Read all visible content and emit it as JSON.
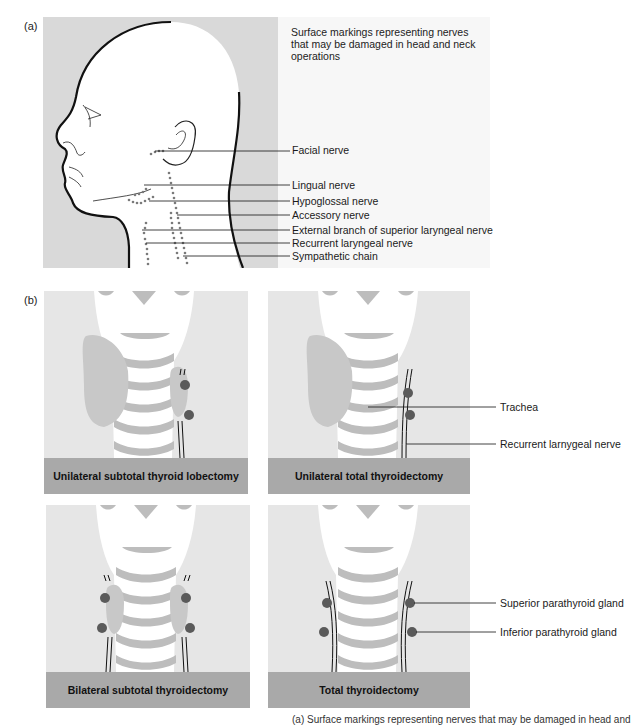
{
  "figure": {
    "panel_a": {
      "tag": "(a)",
      "description": "Surface markings representing nerves that may be damaged in head and neck operations",
      "labels": [
        {
          "text": "Facial nerve",
          "y": 148
        },
        {
          "text": "Lingual nerve",
          "y": 185
        },
        {
          "text": "Hypoglossal nerve",
          "y": 201
        },
        {
          "text": "Accessory nerve",
          "y": 215
        },
        {
          "text": "External branch of superior laryngeal nerve",
          "y": 230
        },
        {
          "text": "Recurrent laryngeal nerve",
          "y": 243
        },
        {
          "text": "Sympathetic chain",
          "y": 256
        }
      ]
    },
    "panel_b": {
      "tag": "(b)",
      "diagrams": [
        {
          "title": "Unilateral subtotal thyroid lobectomy"
        },
        {
          "title": "Unilateral total thyroidectomy"
        },
        {
          "title": "Bilateral subtotal thyroidectomy"
        },
        {
          "title": "Total thyroidectomy"
        }
      ],
      "labels": {
        "trachea": "Trachea",
        "recurrent_nerve": "Recurrent larnygeal nerve",
        "superior_parathyroid": "Superior parathyroid gland",
        "inferior_parathyroid": "Inferior parathyroid gland"
      }
    },
    "caption_partial": "(a) Surface markings representing nerves that may be damaged in head and",
    "colors": {
      "panel_bg": "#e6e6e6",
      "head_panel_bg": "#d9d9d9",
      "thyroid": "#c8c8c8",
      "cartilage": "#bdbdbd",
      "parathyroid": "#5a5a5a",
      "label_bar": "#a9a9a9",
      "nerve_dots": "#7a7a7a"
    }
  }
}
